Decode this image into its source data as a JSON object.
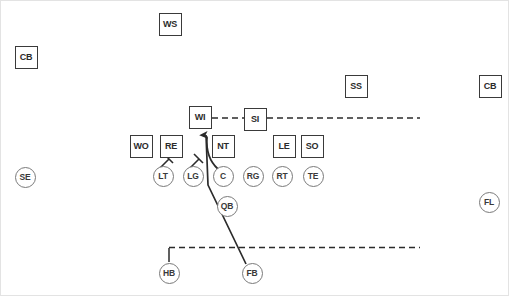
{
  "diagram": {
    "width": 509,
    "height": 296,
    "background_color": "#ffffff",
    "border_color": "#e3e3e3",
    "box_stroke_color": "#3a3a3a",
    "circle_stroke_color": "#7a7a7a",
    "route_color": "#2b2b2b",
    "label_color": "#2b2b2b"
  },
  "defense": {
    "group_label": "Defense",
    "shape": "box",
    "players": [
      {
        "label": "WS",
        "x": 169,
        "y": 23,
        "name": "weak-safety"
      },
      {
        "label": "CB",
        "x": 25,
        "y": 56,
        "name": "cornerback-left"
      },
      {
        "label": "SS",
        "x": 355,
        "y": 85,
        "name": "strong-safety"
      },
      {
        "label": "CB",
        "x": 489,
        "y": 85,
        "name": "cornerback-right"
      },
      {
        "label": "WI",
        "x": 199,
        "y": 116,
        "name": "will-linebacker"
      },
      {
        "label": "SI",
        "x": 254,
        "y": 118,
        "name": "sam-linebacker"
      },
      {
        "label": "WO",
        "x": 140,
        "y": 145,
        "name": "weak-outside-linebacker"
      },
      {
        "label": "RE",
        "x": 170,
        "y": 145,
        "name": "right-end"
      },
      {
        "label": "NT",
        "x": 222,
        "y": 145,
        "name": "nose-tackle"
      },
      {
        "label": "LE",
        "x": 283,
        "y": 145,
        "name": "left-end"
      },
      {
        "label": "SO",
        "x": 311,
        "y": 145,
        "name": "strong-outside-linebacker"
      }
    ]
  },
  "offense": {
    "group_label": "Offense",
    "shape": "circle",
    "players": [
      {
        "label": "SE",
        "x": 24,
        "y": 176,
        "name": "split-end"
      },
      {
        "label": "LT",
        "x": 162,
        "y": 175,
        "name": "left-tackle"
      },
      {
        "label": "LG",
        "x": 192,
        "y": 175,
        "name": "left-guard"
      },
      {
        "label": "C",
        "x": 222,
        "y": 175,
        "name": "center"
      },
      {
        "label": "RG",
        "x": 252,
        "y": 175,
        "name": "right-guard"
      },
      {
        "label": "RT",
        "x": 281,
        "y": 175,
        "name": "right-tackle"
      },
      {
        "label": "TE",
        "x": 312,
        "y": 175,
        "name": "tight-end"
      },
      {
        "label": "FL",
        "x": 488,
        "y": 201,
        "name": "flanker"
      },
      {
        "label": "QB",
        "x": 226,
        "y": 205,
        "name": "quarterback"
      },
      {
        "label": "HB",
        "x": 168,
        "y": 272,
        "name": "halfback"
      },
      {
        "label": "FB",
        "x": 251,
        "y": 272,
        "name": "fullback"
      }
    ]
  },
  "routes": [
    {
      "name": "will-to-sam-coverage-line",
      "style": "dashed",
      "from": "WI",
      "to": "right-sideline",
      "description": "Dashed horizontal coverage line from WI through SI extending to the right"
    },
    {
      "name": "halfback-motion-line",
      "style": "dashed",
      "from": "HB",
      "to": "right-sideline",
      "description": "Halfback stem up then dashed motion path to the right"
    },
    {
      "name": "fullback-lead-path",
      "style": "solid-arrow",
      "from": "FB",
      "to": "WI",
      "description": "Fullback solid lead path up-left through the line with arrowhead"
    },
    {
      "name": "center-block-branch",
      "style": "solid-curve",
      "from": "C",
      "to": "NT",
      "description": "Curved branch block from center area toward nose tackle"
    },
    {
      "name": "left-tackle-block",
      "style": "block-tee",
      "from": "LT",
      "to": "RE",
      "description": "Left tackle block symbol with perpendicular cap"
    },
    {
      "name": "left-guard-block",
      "style": "block-tee",
      "from": "LG",
      "to": "NT",
      "description": "Left guard block symbol with perpendicular cap"
    }
  ]
}
